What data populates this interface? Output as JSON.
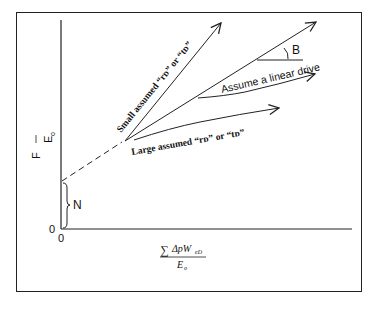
{
  "figure": {
    "y_axis_label": {
      "numerator": "F",
      "denominator": "E",
      "denominator_sub": "o"
    },
    "x_axis_label": {
      "sum": "∑",
      "numerator_main": "ΔpW",
      "numerator_sub": "eD",
      "denominator_main": "E",
      "denominator_sub": "o"
    },
    "origin_x": "0",
    "origin_y": "0",
    "intercept_label": "N",
    "angle_label": "B",
    "annotations": {
      "small": "Small assumed “rᴅ” or “tᴅ”",
      "linear": "Assume a linear drive",
      "large": "Large assumed “rᴅ” or “tᴅ”"
    },
    "line_color": "#222222",
    "background": "#ffffff"
  }
}
